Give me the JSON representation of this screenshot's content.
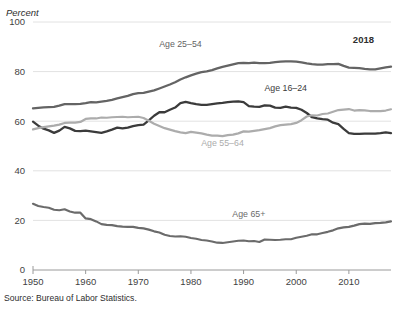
{
  "axis": {
    "unit_label": "Percent",
    "y_ticks": [
      0,
      20,
      40,
      60,
      80,
      100
    ],
    "x_ticks": [
      1950,
      1960,
      1970,
      1980,
      1990,
      2000,
      2010
    ]
  },
  "annotation_end_year": "2018",
  "source_note": "Source: Bureau of Labor Statistics.",
  "labels": {
    "age_25_54": "Age 25–54",
    "age_16_24": "Age 16–24",
    "age_55_64": "Age 55–64",
    "age_65p": "Age 65+"
  },
  "colors": {
    "age_16_24": "#3b3b3b",
    "age_25_54": "#646464",
    "age_55_64": "#acacac",
    "age_65p": "#6b6b6b",
    "grid": "#e2e2e2",
    "axis": "#9a9a9a",
    "text": "#3f3f3f"
  },
  "chart_data": {
    "type": "line",
    "title": "",
    "xlabel": "",
    "ylabel": "Percent",
    "xlim": [
      1950,
      2018
    ],
    "ylim": [
      0,
      100
    ],
    "grid": true,
    "legend": "inline-labels",
    "x": [
      1950,
      1951,
      1952,
      1953,
      1954,
      1955,
      1956,
      1957,
      1958,
      1959,
      1960,
      1961,
      1962,
      1963,
      1964,
      1965,
      1966,
      1967,
      1968,
      1969,
      1970,
      1971,
      1972,
      1973,
      1974,
      1975,
      1976,
      1977,
      1978,
      1979,
      1980,
      1981,
      1982,
      1983,
      1984,
      1985,
      1986,
      1987,
      1988,
      1989,
      1990,
      1991,
      1992,
      1993,
      1994,
      1995,
      1996,
      1997,
      1998,
      1999,
      2000,
      2001,
      2002,
      2003,
      2004,
      2005,
      2006,
      2007,
      2008,
      2009,
      2010,
      2011,
      2012,
      2013,
      2014,
      2015,
      2016,
      2017,
      2018
    ],
    "series": [
      {
        "name": "Age 25–54",
        "color": "#646464",
        "label_x": 1978,
        "label_y": 90,
        "values": [
          65.2,
          65.4,
          65.6,
          65.7,
          65.8,
          66.3,
          66.9,
          66.9,
          66.9,
          67.0,
          67.3,
          67.7,
          67.6,
          67.9,
          68.2,
          68.6,
          69.2,
          69.7,
          70.2,
          70.9,
          71.3,
          71.4,
          71.9,
          72.4,
          73.2,
          74.0,
          74.8,
          75.7,
          76.8,
          77.7,
          78.5,
          79.2,
          79.8,
          80.1,
          80.6,
          81.3,
          81.9,
          82.4,
          82.9,
          83.4,
          83.5,
          83.4,
          83.6,
          83.4,
          83.4,
          83.5,
          83.8,
          84.0,
          84.1,
          84.1,
          84.0,
          83.7,
          83.3,
          83.0,
          82.8,
          82.8,
          83.0,
          83.0,
          83.1,
          82.3,
          81.6,
          81.5,
          81.4,
          81.1,
          80.9,
          80.9,
          81.3,
          81.7,
          82.0
        ]
      },
      {
        "name": "Age 16–24",
        "color": "#3b3b3b",
        "label_x": 1998,
        "label_y": 72,
        "values": [
          59.8,
          58.2,
          57.0,
          56.3,
          55.3,
          56.2,
          57.7,
          57.1,
          56.1,
          56.0,
          56.2,
          55.9,
          55.6,
          55.3,
          55.9,
          56.6,
          57.4,
          57.1,
          57.4,
          58.0,
          58.4,
          58.6,
          60.3,
          62.2,
          63.6,
          63.6,
          64.6,
          65.5,
          67.3,
          67.8,
          67.3,
          66.9,
          66.6,
          66.6,
          66.9,
          67.2,
          67.4,
          67.7,
          67.9,
          68.0,
          67.7,
          66.1,
          65.9,
          65.8,
          66.4,
          66.3,
          65.5,
          65.4,
          65.9,
          65.5,
          65.4,
          64.6,
          63.3,
          61.6,
          61.1,
          60.8,
          60.6,
          59.4,
          58.8,
          56.9,
          55.2,
          54.9,
          54.9,
          55.0,
          55.0,
          55.0,
          55.2,
          55.5,
          55.2
        ]
      },
      {
        "name": "Age 55–64",
        "color": "#acacac",
        "label_x": 1986,
        "label_y": 50,
        "values": [
          56.7,
          57.2,
          57.6,
          57.9,
          58.2,
          58.6,
          59.3,
          59.4,
          59.4,
          59.7,
          60.9,
          61.1,
          61.1,
          61.5,
          61.4,
          61.6,
          61.7,
          61.8,
          61.6,
          61.7,
          61.8,
          61.3,
          60.2,
          59.0,
          58.1,
          57.2,
          56.6,
          56.0,
          55.5,
          55.2,
          55.7,
          55.4,
          55.1,
          54.6,
          54.2,
          54.2,
          54.0,
          54.4,
          54.6,
          55.1,
          55.9,
          55.8,
          56.1,
          56.4,
          56.8,
          57.2,
          57.9,
          58.4,
          58.6,
          58.8,
          59.3,
          60.4,
          61.9,
          62.4,
          62.3,
          62.9,
          63.1,
          63.8,
          64.5,
          64.7,
          64.9,
          64.3,
          64.5,
          64.4,
          64.1,
          64.1,
          64.1,
          64.3,
          64.8
        ]
      },
      {
        "name": "Age 65+",
        "color": "#6b6b6b",
        "label_x": 1991,
        "label_y": 21.5,
        "values": [
          26.7,
          25.8,
          25.4,
          25.1,
          24.3,
          24.1,
          24.5,
          23.6,
          23.1,
          23.1,
          20.8,
          20.5,
          19.6,
          18.5,
          18.2,
          18.1,
          17.7,
          17.5,
          17.4,
          17.4,
          17.0,
          16.8,
          16.3,
          15.6,
          15.1,
          14.2,
          13.7,
          13.5,
          13.6,
          13.4,
          12.9,
          12.6,
          12.1,
          11.9,
          11.5,
          11.0,
          10.9,
          11.2,
          11.5,
          11.8,
          11.9,
          11.6,
          11.7,
          11.3,
          12.3,
          12.2,
          12.1,
          12.2,
          12.4,
          12.4,
          13.0,
          13.4,
          13.8,
          14.4,
          14.4,
          14.9,
          15.4,
          16.0,
          16.8,
          17.2,
          17.4,
          17.9,
          18.5,
          18.7,
          18.6,
          18.9,
          19.0,
          19.2,
          19.6
        ]
      }
    ]
  }
}
